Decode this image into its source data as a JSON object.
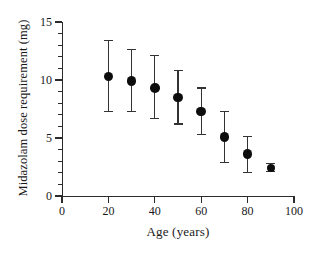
{
  "chart_data": {
    "type": "scatter",
    "title": "",
    "xlabel": "Age (years)",
    "ylabel": "Midazolam dose requirement (mg)",
    "xlim": [
      0,
      100
    ],
    "ylim": [
      0,
      15
    ],
    "xticks": [
      0,
      20,
      40,
      60,
      80,
      100
    ],
    "xtick_labels": [
      "0",
      "20",
      "40",
      "60",
      "80",
      "100"
    ],
    "yticks": [
      0,
      5,
      10,
      15
    ],
    "ytick_labels": [
      "0",
      "5",
      "10",
      "15"
    ],
    "yminorticks": [
      1,
      2,
      3,
      4,
      6,
      7,
      8,
      9,
      11,
      12,
      13,
      14
    ],
    "grid": false,
    "legend": null,
    "marker": "filled-circle",
    "errorbars": true,
    "x": [
      20,
      30,
      40,
      50,
      60,
      70,
      80,
      90
    ],
    "values": [
      10.3,
      9.9,
      9.3,
      8.5,
      7.3,
      5.1,
      3.6,
      2.4
    ],
    "err_low": [
      7.3,
      7.3,
      6.7,
      6.2,
      5.3,
      2.9,
      2.0,
      2.1
    ],
    "err_high": [
      13.4,
      12.6,
      12.1,
      10.8,
      9.3,
      7.3,
      5.1,
      2.8
    ],
    "series": [
      {
        "name": "Midazolam dose requirement",
        "points": [
          {
            "x": 20,
            "y": 10.3,
            "low": 7.3,
            "high": 13.4
          },
          {
            "x": 30,
            "y": 9.9,
            "low": 7.3,
            "high": 12.6
          },
          {
            "x": 40,
            "y": 9.3,
            "low": 6.7,
            "high": 12.1
          },
          {
            "x": 50,
            "y": 8.5,
            "low": 6.2,
            "high": 10.8
          },
          {
            "x": 60,
            "y": 7.3,
            "low": 5.3,
            "high": 9.3
          },
          {
            "x": 70,
            "y": 5.1,
            "low": 2.9,
            "high": 7.3
          },
          {
            "x": 80,
            "y": 3.6,
            "low": 2.0,
            "high": 5.1
          },
          {
            "x": 90,
            "y": 2.4,
            "low": 2.1,
            "high": 2.8
          }
        ]
      }
    ]
  },
  "axis_colors": {
    "axis": "#2b2b2b",
    "marker": "#0d0d0d",
    "errorbar": "#333333",
    "background": "#ffffff"
  }
}
